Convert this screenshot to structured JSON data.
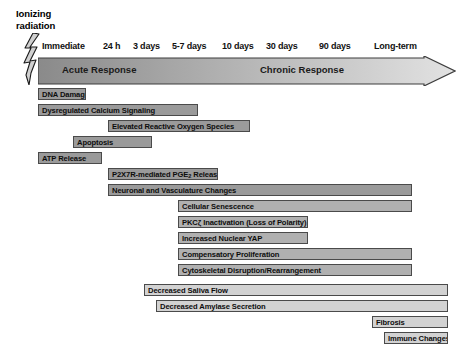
{
  "source_label": "Ionizing\nradiation",
  "timeline": {
    "ticks": [
      {
        "label": "Immediate",
        "x": 42
      },
      {
        "label": "24 h",
        "x": 103
      },
      {
        "label": "3 days",
        "x": 133
      },
      {
        "label": "5-7 days",
        "x": 172
      },
      {
        "label": "10 days",
        "x": 222
      },
      {
        "label": "30 days",
        "x": 266
      },
      {
        "label": "90 days",
        "x": 319
      },
      {
        "label": "Long-term",
        "x": 374
      }
    ],
    "tick_y": 41
  },
  "phases": {
    "acute": "Acute Response",
    "chronic": "Chronic Response",
    "gradient_start": "#8a8a8a",
    "gradient_end": "#e2e2e2"
  },
  "events": [
    {
      "label": "DNA Damage",
      "x": 38,
      "w": 48,
      "y": 88,
      "shade": "dark"
    },
    {
      "label": "Dysregulated Calcium Signaling",
      "x": 38,
      "w": 160,
      "y": 104,
      "shade": "dark"
    },
    {
      "label": "Elevated Reactive Oxygen Species",
      "x": 108,
      "w": 142,
      "y": 120,
      "shade": "dark"
    },
    {
      "label": "Apoptosis",
      "x": 73,
      "w": 79,
      "y": 136,
      "shade": "dark"
    },
    {
      "label": "ATP Release",
      "x": 38,
      "w": 64,
      "y": 152,
      "shade": "dark"
    },
    {
      "label": "P2X7R-mediated PGE|2| Release",
      "x": 108,
      "w": 110,
      "y": 168,
      "shade": "dark"
    },
    {
      "label": "Neuronal and Vasculature Changes",
      "x": 108,
      "w": 304,
      "y": 184,
      "shade": "dark"
    },
    {
      "label": "Cellular Senescence",
      "x": 178,
      "w": 234,
      "y": 200,
      "shade": "mid"
    },
    {
      "label": "PKCζ Inactivation (Loss of Polarity)",
      "x": 178,
      "w": 130,
      "y": 216,
      "shade": "mid"
    },
    {
      "label": "Increased Nuclear YAP",
      "x": 178,
      "w": 130,
      "y": 232,
      "shade": "mid"
    },
    {
      "label": "Compensatory Proliferation",
      "x": 178,
      "w": 234,
      "y": 248,
      "shade": "mid"
    },
    {
      "label": "Cytoskeletal Disruption/Rearrangement",
      "x": 178,
      "w": 234,
      "y": 264,
      "shade": "mid"
    },
    {
      "label": "Decreased Saliva Flow",
      "x": 144,
      "w": 304,
      "y": 284,
      "shade": "light"
    },
    {
      "label": "Decreased Amylase Secretion",
      "x": 156,
      "w": 292,
      "y": 300,
      "shade": "light"
    },
    {
      "label": "Fibrosis",
      "x": 372,
      "w": 76,
      "y": 316,
      "shade": "light"
    },
    {
      "label": "Immune Changes",
      "x": 384,
      "w": 64,
      "y": 332,
      "shade": "light"
    }
  ]
}
